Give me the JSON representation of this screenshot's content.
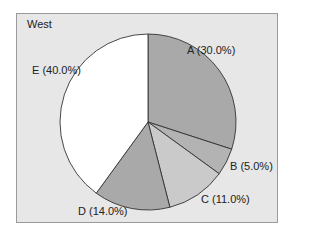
{
  "chart_data": {
    "type": "pie",
    "title": "West",
    "categories": [
      "A",
      "B",
      "C",
      "D",
      "E"
    ],
    "values": [
      30.0,
      5.0,
      11.0,
      14.0,
      40.0
    ],
    "labels": [
      "A (30.0%)",
      "B (5.0%)",
      "C (11.0%)",
      "D (14.0%)",
      "E (40.0%)"
    ],
    "colors": [
      "#a9a9a9",
      "#b3b3b3",
      "#cacaca",
      "#a9a9a9",
      "#ffffff"
    ],
    "start_angle": "12 o'clock, clockwise",
    "legend": "none (direct labels)"
  },
  "labels": {
    "title": "West",
    "a": "A (30.0%)",
    "b": "B (5.0%)",
    "c": "C (11.0%)",
    "d": "D (14.0%)",
    "e": "E (40.0%)"
  }
}
